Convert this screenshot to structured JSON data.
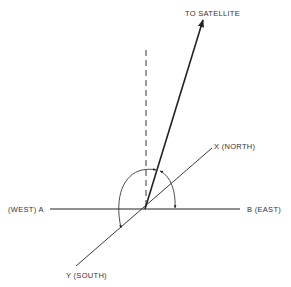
{
  "diagram": {
    "type": "satellite-look-angle geometry",
    "labels": {
      "satellite": "TO SATELLITE",
      "north": "X (NORTH)",
      "east": "B (EAST)",
      "west": "(WEST) A",
      "south": "Y (SOUTH)"
    },
    "colors": {
      "stroke": "#222222",
      "text": "#333333",
      "background": "#ffffff"
    },
    "geometry": {
      "origin": [
        145,
        209
      ],
      "west_end": [
        50,
        209
      ],
      "east_end": [
        240,
        209
      ],
      "north_end": [
        212,
        148
      ],
      "south_end": [
        76,
        266
      ],
      "satellite_tip": [
        203,
        19
      ],
      "vertical_dashed_top": [
        146,
        50
      ]
    },
    "arcs": [
      {
        "name": "azimuth-arc",
        "from": "south-axis",
        "to": "satellite-projection"
      },
      {
        "name": "elevation-arc",
        "from": "satellite-vector",
        "to": "east-axis"
      }
    ]
  }
}
